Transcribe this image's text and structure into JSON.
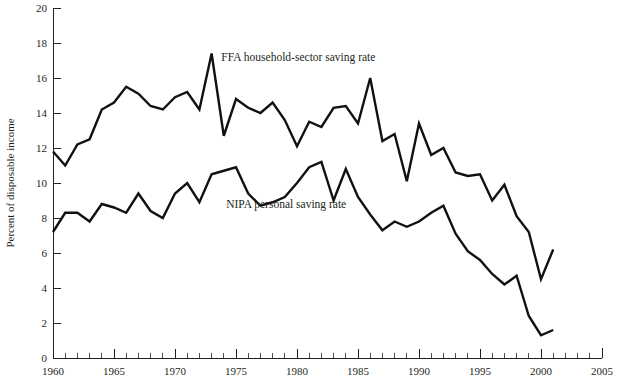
{
  "chart_data": {
    "type": "line",
    "title": "",
    "subtitle": "",
    "xlabel": "",
    "ylabel": "Percent of disposable income",
    "xlim": [
      1960,
      2005
    ],
    "ylim": [
      0,
      20
    ],
    "grid": false,
    "legend_position": "inline-annotation",
    "y_ticks": [
      0,
      2,
      4,
      6,
      8,
      10,
      12,
      14,
      16,
      18,
      20
    ],
    "y_tick_labels": [
      "0",
      "2",
      "4",
      "6",
      "8",
      "10",
      "12",
      "14",
      "16",
      "18",
      "20"
    ],
    "y_tick_step": 2,
    "x_ticks": [
      1960,
      1965,
      1970,
      1975,
      1980,
      1985,
      1990,
      1995,
      2000,
      2005
    ],
    "x_tick_labels": [
      "1960",
      "1965",
      "1970",
      "1975",
      "1980",
      "1985",
      "1990",
      "1995",
      "2000",
      "2005"
    ],
    "x_minor_tick_step": 1,
    "annotations": [
      {
        "text": "FFA household-sector saving rate",
        "x": 1973.8,
        "y": 17.0
      },
      {
        "text": "NIPA personal saving rate",
        "x": 1974.2,
        "y": 8.55
      }
    ],
    "series": [
      {
        "name": "FFA household-sector saving rate",
        "color": "#111111",
        "x": [
          1960,
          1961,
          1962,
          1963,
          1964,
          1965,
          1966,
          1967,
          1968,
          1969,
          1970,
          1971,
          1972,
          1973,
          1974,
          1975,
          1976,
          1977,
          1978,
          1979,
          1980,
          1981,
          1982,
          1983,
          1984,
          1985,
          1986,
          1987,
          1988,
          1989,
          1990,
          1991,
          1992,
          1993,
          1994,
          1995,
          1996,
          1997,
          1998,
          1999,
          2000,
          2001
        ],
        "values": [
          11.8,
          11.0,
          12.2,
          12.5,
          14.2,
          14.6,
          15.5,
          15.1,
          14.4,
          14.2,
          14.9,
          15.2,
          14.2,
          17.4,
          12.7,
          14.8,
          14.3,
          14.0,
          14.6,
          13.6,
          12.1,
          13.5,
          13.2,
          14.3,
          14.4,
          13.4,
          16.0,
          12.4,
          12.8,
          10.1,
          13.4,
          11.6,
          12.0,
          10.6,
          10.4,
          10.5,
          9.0,
          9.9,
          8.1,
          7.2,
          4.5,
          6.2
        ]
      },
      {
        "name": "NIPA personal saving rate",
        "color": "#111111",
        "x": [
          1960,
          1961,
          1962,
          1963,
          1964,
          1965,
          1966,
          1967,
          1968,
          1969,
          1970,
          1971,
          1972,
          1973,
          1974,
          1975,
          1976,
          1977,
          1978,
          1979,
          1980,
          1981,
          1982,
          1983,
          1984,
          1985,
          1986,
          1987,
          1988,
          1989,
          1990,
          1991,
          1992,
          1993,
          1994,
          1995,
          1996,
          1997,
          1998,
          1999,
          2000,
          2001
        ],
        "values": [
          7.2,
          8.3,
          8.3,
          7.8,
          8.8,
          8.6,
          8.3,
          9.4,
          8.4,
          8.0,
          9.4,
          10.0,
          8.9,
          10.5,
          10.7,
          10.9,
          9.4,
          8.7,
          8.9,
          9.2,
          10.0,
          10.9,
          11.2,
          9.0,
          10.8,
          9.2,
          8.2,
          7.3,
          7.8,
          7.5,
          7.8,
          8.3,
          8.7,
          7.1,
          6.1,
          5.6,
          4.8,
          4.2,
          4.7,
          2.4,
          1.3,
          1.6
        ]
      }
    ]
  }
}
